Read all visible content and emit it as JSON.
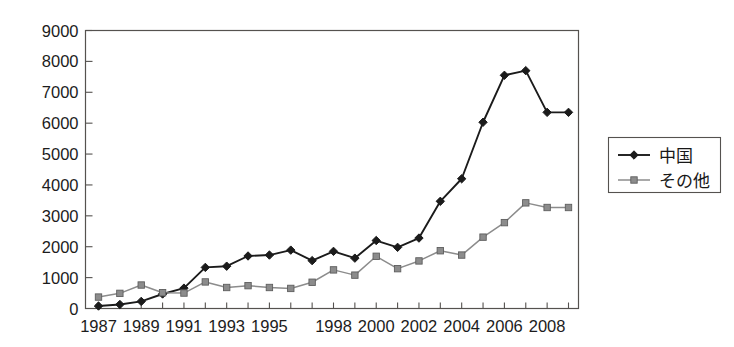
{
  "chart_data": {
    "type": "line",
    "title": "",
    "subtitle": "",
    "xlabel": "",
    "ylabel": "",
    "x": [
      1987,
      1988,
      1989,
      1990,
      1991,
      1992,
      1993,
      1994,
      1995,
      1996,
      1997,
      1998,
      1999,
      2000,
      2001,
      2002,
      2003,
      2004,
      2005,
      2006,
      2007,
      2008,
      2009
    ],
    "categories": [
      "1987",
      "1988",
      "1989",
      "1990",
      "1991",
      "1992",
      "1993",
      "1994",
      "1995",
      "1996",
      "1997",
      "1998",
      "1999",
      "2000",
      "2001",
      "2002",
      "2003",
      "2004",
      "2005",
      "2006",
      "2007",
      "2008",
      "2009"
    ],
    "xtick_labels": [
      "1987",
      "",
      "1989",
      "",
      "1991",
      "",
      "1993",
      "",
      "1995",
      "",
      "",
      "1998",
      "",
      "2000",
      "",
      "2002",
      "",
      "2004",
      "",
      "2006",
      "",
      "2008",
      ""
    ],
    "ytick_labels": [
      "0",
      "1000",
      "2000",
      "3000",
      "4000",
      "5000",
      "6000",
      "7000",
      "8000",
      "9000"
    ],
    "ylim": [
      0,
      9000
    ],
    "ytick_step": 1000,
    "grid": false,
    "legend_position": "right",
    "series": [
      {
        "name": "中国",
        "color": "#1b1b1b",
        "marker": "diamond",
        "values": [
          80,
          130,
          230,
          470,
          660,
          1330,
          1370,
          1700,
          1730,
          1890,
          1550,
          1850,
          1630,
          2200,
          1980,
          2280,
          3470,
          4200,
          6030,
          7550,
          7700,
          6350,
          6350
        ]
      },
      {
        "name": "その他",
        "color": "#8c8c8c",
        "marker": "square",
        "values": [
          370,
          490,
          760,
          510,
          500,
          860,
          680,
          740,
          680,
          650,
          850,
          1250,
          1080,
          1690,
          1290,
          1540,
          1870,
          1730,
          2310,
          2780,
          3420,
          3270,
          3270
        ]
      }
    ]
  },
  "legend": {
    "items": [
      {
        "label": "中国",
        "marker": "diamond",
        "color": "#1b1b1b"
      },
      {
        "label": "その他",
        "marker": "square",
        "color": "#8c8c8c"
      }
    ]
  }
}
